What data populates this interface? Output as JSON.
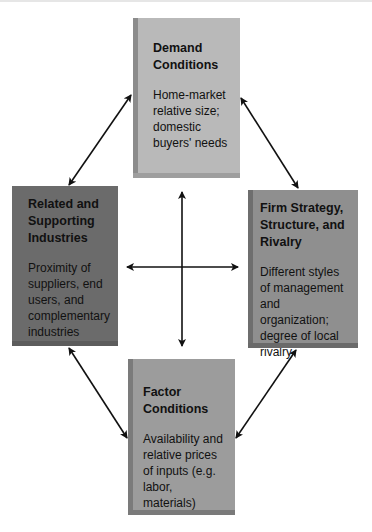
{
  "diagram": {
    "boxes": {
      "demand": {
        "title": "Demand Conditions",
        "description": "Home-market relative size; domestic buyers' needs",
        "color": "#b9b9b9"
      },
      "related": {
        "title": "Related and Supporting Industries",
        "description": "Proximity of suppliers, end users, and complementary industries",
        "color": "#6b6b6b"
      },
      "firm": {
        "title": "Firm Strategy, Structure, and Rivalry",
        "description": "Different styles of management and organization; degree of local rivalry",
        "color": "#8f8f8f"
      },
      "factor": {
        "title": "Factor Conditions",
        "description": "Availability and relative prices of inputs (e.g. labor, materials)",
        "color": "#9c9c9c"
      }
    },
    "connections": [
      {
        "from": "demand",
        "to": "related",
        "type": "bidirectional"
      },
      {
        "from": "demand",
        "to": "firm",
        "type": "bidirectional"
      },
      {
        "from": "related",
        "to": "factor",
        "type": "bidirectional"
      },
      {
        "from": "firm",
        "to": "factor",
        "type": "bidirectional"
      },
      {
        "from": "center",
        "to": "all",
        "type": "cross"
      }
    ]
  }
}
